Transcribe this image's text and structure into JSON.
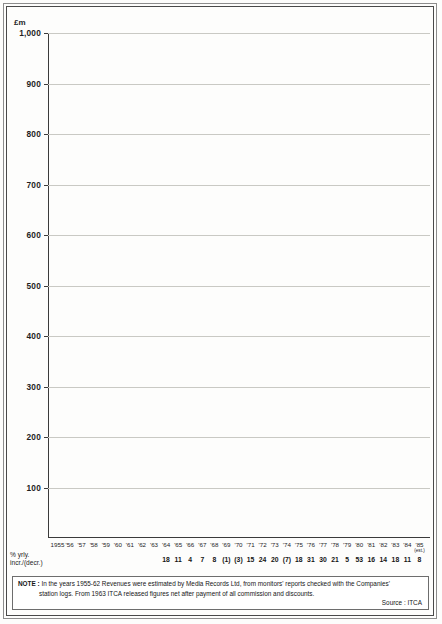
{
  "chart_data": {
    "type": "line",
    "title": "",
    "ylabel": "£m",
    "xlabel": "",
    "ylim": [
      0,
      1000
    ],
    "yticks": [
      1000,
      900,
      800,
      700,
      600,
      500,
      400,
      300,
      200,
      100
    ],
    "ytick_labels": [
      "1,000",
      "900",
      "800",
      "700",
      "600",
      "500",
      "400",
      "300",
      "200",
      "100"
    ],
    "grid": true,
    "legend": "none",
    "x_tick_labels": [
      "1955",
      "'56",
      "'57",
      "'58",
      "'59",
      "'60",
      "'61",
      "'62",
      "'63",
      "'64",
      "'65",
      "'66",
      "'67",
      "'68",
      "'69",
      "'70",
      "'71",
      "'72",
      "'73",
      "'74",
      "'75",
      "'76",
      "'77",
      "'78",
      "'79",
      "'80",
      "'81",
      "'82",
      "'83",
      "'84",
      "'85"
    ],
    "x_last_annotation": "(est.)",
    "point_labels": [
      "£13,024",
      "£31,986",
      "£48,671",
      "£58,359",
      "£76,960",
      "£93,276",
      "£62,932",
      "£99,794",
      "£74,433",
      "£85,825",
      "£82,840",
      "£98,759",
      "£91,776",
      "£97,540",
      "£94,742",
      "£108,634",
      "£134,162",
      "£160,831",
      "£149,245",
      "£176,532",
      "£230,807",
      "£299,887",
      "£363,005",
      "£346,796",
      "£529,311",
      "£611,236",
      "£697,079",
      "£824,311",
      "£912,266",
      "£982,603"
    ],
    "values": [
      13024,
      31986,
      48671,
      58359,
      76960,
      93276,
      62932,
      99794,
      74433,
      85825,
      82840,
      98759,
      91776,
      97540,
      94742,
      108634,
      134162,
      160831,
      149245,
      176532,
      230807,
      299887,
      363005,
      346796,
      529311,
      611236,
      697079,
      824311,
      912266,
      982603
    ],
    "series": [
      {
        "name": "Net advertising revenue",
        "values": [
          13024,
          31986,
          48671,
          58359,
          76960,
          93276,
          62932,
          99794,
          74433,
          85825,
          82840,
          98759,
          91776,
          97540,
          94742,
          108634,
          134162,
          160831,
          149245,
          176532,
          230807,
          299887,
          363005,
          346796,
          529311,
          611236,
          697079,
          824311,
          912266,
          982603
        ]
      }
    ],
    "percent_change_caption": "% yrly. incr./(decr.)",
    "percent_change": [
      "",
      "",
      "",
      "",
      "",
      "",
      "",
      "",
      "",
      "",
      "",
      "",
      "",
      "",
      "",
      "18",
      "11",
      "4",
      "7",
      "8",
      "(1)",
      "(3)",
      "15",
      "24",
      "20",
      "(7)",
      "18",
      "31",
      "30",
      "21",
      "5",
      "53",
      "16",
      "14",
      "18",
      "11",
      "8"
    ],
    "percent_change_visible": [
      "18",
      "11",
      "4",
      "7",
      "8",
      "(1)",
      "(3)",
      "15",
      "24",
      "20",
      "(7)",
      "18",
      "31",
      "30",
      "21",
      "5",
      "53",
      "16",
      "14",
      "18",
      "11",
      "8"
    ]
  },
  "note": {
    "label": "NOTE :",
    "line1": "In the years 1955-62 Revenues were estimated by Media Records Ltd, from monitors' reports checked with the Companies'",
    "line2": "station logs.    From 1963 ITCA released figures net after payment of all commission and discounts.",
    "source": "Source : ITCA"
  },
  "colors": {
    "curve": "#d9d9d6",
    "marker": "#232323",
    "grid": "#c9c9c4",
    "axis": "#3b3b3b",
    "text": "#1c1c1c",
    "background": "#fdfdfc"
  }
}
